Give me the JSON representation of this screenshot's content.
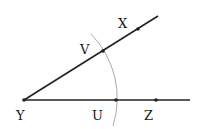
{
  "diagram": {
    "type": "angle-construction",
    "colors": {
      "line": "#222222",
      "arc": "#aaaaaa",
      "text": "#1a1a1a"
    },
    "vertex": {
      "label": "Y",
      "x": 24,
      "y": 100,
      "label_x": 16,
      "label_y": 120
    },
    "rays": [
      {
        "name": "upper-ray",
        "x1": 24,
        "y1": 100,
        "x2": 158,
        "y2": 16
      },
      {
        "name": "lower-ray",
        "x1": 24,
        "y1": 100,
        "x2": 190,
        "y2": 100
      }
    ],
    "points": [
      {
        "label": "X",
        "x": 138,
        "y": 29,
        "label_x": 118,
        "label_y": 28
      },
      {
        "label": "V",
        "x": 103,
        "y": 51,
        "label_x": 80,
        "label_y": 54
      },
      {
        "label": "U",
        "x": 116,
        "y": 100,
        "label_x": 92,
        "label_y": 120
      },
      {
        "label": "Z",
        "x": 156,
        "y": 100,
        "label_x": 144,
        "label_y": 120
      }
    ],
    "arc": {
      "center_x": 24,
      "center_y": 100,
      "radius": 92,
      "start_x": 91,
      "start_y": 34,
      "end_x": 113,
      "end_y": 126
    }
  }
}
